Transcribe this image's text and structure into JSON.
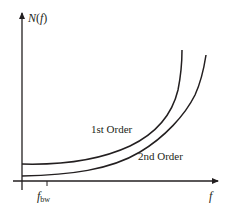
{
  "diagram": {
    "y_axis_label": "N(f)",
    "y_axis_label_parts": {
      "fn": "N",
      "open": "(",
      "var": "f",
      "close": ")"
    },
    "x_axis_label": "f",
    "x_tick_label": {
      "base": "f",
      "subscript": "bw"
    },
    "curves": [
      {
        "name": "1st Order",
        "label": "1st Order"
      },
      {
        "name": "2nd Order",
        "label": "2nd Order"
      }
    ],
    "colors": {
      "line": "#231f20",
      "background": "#ffffff"
    }
  }
}
